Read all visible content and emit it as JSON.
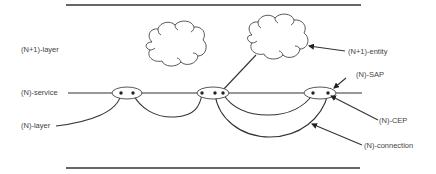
{
  "diagram": {
    "labels": {
      "n_plus_1_layer": "(N+1)-layer",
      "n_service": "(N)-service",
      "n_layer": "(N)-layer",
      "n_plus_1_entity": "(N+1)-entity",
      "n_sap": "(N)-SAP",
      "n_cep": "(N)-CEP",
      "n_connection": "(N)-connection"
    },
    "colors": {
      "line": "#333333",
      "text": "#444444",
      "background": "#ffffff"
    },
    "elements": {
      "clouds": [
        "(N+1)-entity left",
        "(N+1)-entity right"
      ],
      "saps": [
        "left SAP",
        "middle SAP",
        "right SAP"
      ],
      "boundaries": [
        "top layer boundary",
        "bottom layer boundary"
      ]
    }
  }
}
